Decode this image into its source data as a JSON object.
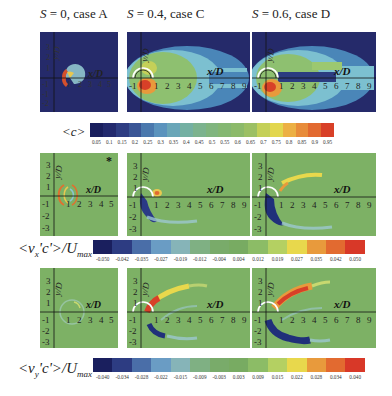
{
  "columns": [
    {
      "s_label": "S",
      "title": " = 0, case A"
    },
    {
      "s_label": "S",
      "title": " = 0.4, case C"
    },
    {
      "s_label": "S",
      "title": " = 0.6, case D"
    }
  ],
  "rows": [
    {
      "quantity": "<c>",
      "colorbar": {
        "label": "<c>",
        "ticks": [
          "0.05",
          "0.1",
          "0.15",
          "0.2",
          "0.25",
          "0.3",
          "0.35",
          "0.4",
          "0.45",
          "0.5",
          "0.55",
          "0.6",
          "0.65",
          "0.7",
          "0.75",
          "0.8",
          "0.85",
          "0.9",
          "0.95"
        ],
        "colors": [
          "#1a1f5e",
          "#232a6e",
          "#2e3d82",
          "#3a5696",
          "#4a78ad",
          "#5b93bd",
          "#6aa6b8",
          "#74b0a2",
          "#7cb38e",
          "#80b57e",
          "#84b772",
          "#8cba6a",
          "#9cc064",
          "#c4d058",
          "#e2d64e",
          "#ecb044",
          "#e88c3a",
          "#e26a30",
          "#d84028"
        ]
      }
    },
    {
      "quantity": "<vx'c'>/Umax",
      "colorbar": {
        "label_main": "<v",
        "label_sub": "x",
        "label_rest": "'c'>/U",
        "label_sub2": "max",
        "ticks": [
          "-0.050",
          "-0.042",
          "-0.035",
          "-0.027",
          "-0.019",
          "-0.012",
          "-0.004",
          "0.004",
          "0.012",
          "0.019",
          "0.027",
          "0.035",
          "0.042",
          "0.050"
        ],
        "colors": [
          "#1a1f5e",
          "#2d3c82",
          "#4a6ea8",
          "#6a9cc4",
          "#86b4b8",
          "#7fb083",
          "#79ab6a",
          "#78ab62",
          "#8cbc66",
          "#b4d062",
          "#e8d84c",
          "#e89a3c",
          "#e26a30",
          "#d83828"
        ]
      },
      "marker": "*"
    },
    {
      "quantity": "<vy'c'>/Umax",
      "colorbar": {
        "label_main": "<v",
        "label_sub": "y",
        "label_rest": "'c'>/U",
        "label_sub2": "max",
        "ticks": [
          "-0.040",
          "-0.034",
          "-0.028",
          "-0.022",
          "-0.015",
          "-0.009",
          "-0.003",
          "0.003",
          "0.009",
          "0.015",
          "0.022",
          "0.028",
          "0.034",
          "0.040"
        ],
        "colors": [
          "#1a1f5e",
          "#2d3c82",
          "#4a6ea8",
          "#6a9cc4",
          "#86b4b8",
          "#7fb083",
          "#79ab6a",
          "#78ab62",
          "#8cbc66",
          "#b4d062",
          "#e8d84c",
          "#e89a3c",
          "#e26a30",
          "#d83828"
        ]
      }
    }
  ],
  "axes": {
    "x_label": "x/D",
    "x_sub": "j",
    "y_label": "y/D",
    "y_sub": "j",
    "case_a_x_ticks": [
      "-1",
      "1",
      "2",
      "3",
      "4",
      "5"
    ],
    "case_cd_x_ticks": [
      "-1",
      "1",
      "2",
      "3",
      "4",
      "5",
      "6",
      "7",
      "8",
      "9"
    ],
    "y_ticks_top": [
      "3",
      "2",
      "1"
    ],
    "y_ticks_bottom": [
      "-1",
      "-2",
      "-3"
    ]
  },
  "chart_data": {
    "type": "heatmap",
    "panels": [
      {
        "row": "<c>",
        "case": "A",
        "S": 0,
        "x_range": [
          -1.5,
          5.5
        ],
        "y_range": [
          -3.5,
          3.5
        ],
        "feature": "small compact high-c region near nozzle, x/Dj < 1"
      },
      {
        "row": "<c>",
        "case": "C",
        "S": 0.4,
        "x_range": [
          -1.5,
          9.5
        ],
        "y_range": [
          -3.5,
          3.5
        ],
        "feature": "wide plume extending to x/Dj ~ 9, peak c ~0.9 near x/Dj 0-1, y/Dj ~ -0.5"
      },
      {
        "row": "<c>",
        "case": "D",
        "S": 0.6,
        "x_range": [
          -1.5,
          9.5
        ],
        "y_range": [
          -3.5,
          3.5
        ],
        "feature": "wide plume with central low-c core along axis, peak near x/Dj 0-1"
      },
      {
        "row": "<vx'c'>/Umax",
        "case": "A",
        "S": 0,
        "feature": "thin ring of +/- flux around x/Dj 0-1"
      },
      {
        "row": "<vx'c'>/Umax",
        "case": "C",
        "S": 0.4,
        "feature": "negative flux (~-0.05) below nozzle to y/Dj -2; positive spot near x/Dj 1.3, y/Dj 0.3"
      },
      {
        "row": "<vx'c'>/Umax",
        "case": "D",
        "S": 0.6,
        "feature": "negative band from nozzle down to y/Dj -2.2; positive band rising to x/Dj 5, y/Dj 2"
      },
      {
        "row": "<vy'c'>/Umax",
        "case": "A",
        "S": 0,
        "feature": "nearly zero, faint ring"
      },
      {
        "row": "<vy'c'>/Umax",
        "case": "C",
        "S": 0.4,
        "feature": "positive band up to x/Dj 4, y/Dj 2; negative band below to x/Dj 1.5, y/Dj -1.8"
      },
      {
        "row": "<vy'c'>/Umax",
        "case": "D",
        "S": 0.6,
        "feature": "strong positive band to x/Dj 4, y/Dj 2.2; strong negative band to x/Dj 3, y/Dj -2.5"
      }
    ],
    "colorbars": [
      {
        "label": "<c>",
        "min": 0.05,
        "max": 0.95,
        "step": 0.05
      },
      {
        "label": "<vx'c'>/Umax",
        "min": -0.05,
        "max": 0.05
      },
      {
        "label": "<vy'c'>/Umax",
        "min": -0.04,
        "max": 0.04
      }
    ]
  }
}
